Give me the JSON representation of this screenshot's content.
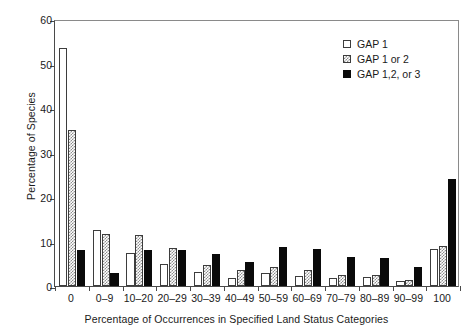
{
  "chart_data": {
    "type": "bar",
    "title": "",
    "xlabel": "Percentage of Occurrences in Specified Land Status Categories",
    "ylabel": "Percentage of Species",
    "categories": [
      "0",
      "0–9",
      "10–20",
      "20–29",
      "30–39",
      "40–49",
      "50–59",
      "60–69",
      "70–79",
      "80–89",
      "90–99",
      "100"
    ],
    "series": [
      {
        "name": "GAP 1",
        "values": [
          53.5,
          12.6,
          7.5,
          5.0,
          3.1,
          1.8,
          3.0,
          2.3,
          1.8,
          2.0,
          1.1,
          8.3
        ]
      },
      {
        "name": "GAP 1 or 2",
        "values": [
          35.0,
          11.6,
          11.4,
          8.5,
          4.8,
          3.7,
          4.2,
          3.6,
          2.4,
          2.4,
          1.3,
          9.0
        ]
      },
      {
        "name": "GAP 1,2, or 3",
        "values": [
          8.2,
          3.0,
          8.0,
          8.0,
          7.3,
          5.3,
          8.8,
          8.4,
          6.5,
          6.2,
          4.3,
          24.1
        ]
      }
    ],
    "ylim": [
      0,
      60
    ],
    "yticks": [
      0,
      10,
      20,
      30,
      40,
      50,
      60
    ],
    "ytick_labels": [
      "0",
      "10",
      "20",
      "30",
      "40",
      "50",
      "60"
    ],
    "grid": false,
    "legend_position": "top-right",
    "legend_entries": [
      "GAP 1",
      "GAP 1 or 2",
      "GAP 1,2, or 3"
    ],
    "series_styles": [
      "open-white",
      "hatched-gray",
      "solid-black"
    ],
    "colors": {
      "series_0": "#ffffff",
      "series_1": "#8d8d8d",
      "series_2": "#0a0a0a",
      "axis": "#4a4a4a",
      "text": "#1a1a1a"
    }
  }
}
